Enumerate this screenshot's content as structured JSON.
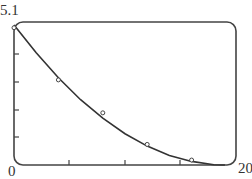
{
  "chart_data": {
    "type": "line",
    "title": "",
    "xlabel": "",
    "ylabel": "",
    "xlim": [
      0,
      20
    ],
    "ylim": [
      0,
      5.1
    ],
    "x_tick_labels": [
      "0",
      "20"
    ],
    "y_tick_labels": [
      "5.1"
    ],
    "x_ticks": [
      5,
      10,
      15
    ],
    "y_ticks": [
      1.02,
      2.04,
      3.06,
      4.08
    ],
    "grid": false,
    "series": [
      {
        "name": "data points",
        "style": "open-circle markers",
        "x": [
          0,
          4,
          8,
          12,
          16
        ],
        "y": [
          5.0,
          3.1,
          1.9,
          0.75,
          0.18
        ]
      },
      {
        "name": "fitted curve",
        "style": "solid line",
        "x": [
          0,
          2,
          4,
          6,
          8,
          10,
          12,
          14,
          16,
          18,
          19
        ],
        "y": [
          5.1,
          4.09,
          3.18,
          2.38,
          1.71,
          1.14,
          0.69,
          0.35,
          0.13,
          0.01,
          0.0
        ]
      }
    ]
  },
  "labels": {
    "y_max": "5.1",
    "origin": "0",
    "x_max": "20"
  }
}
